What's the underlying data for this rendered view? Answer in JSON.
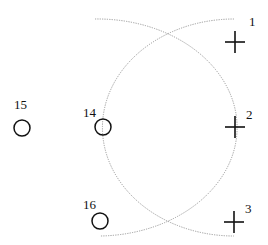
{
  "crosses": [
    {
      "id": "1",
      "x": 235,
      "y": 42,
      "label": "1",
      "lx": 249,
      "ly": 26
    },
    {
      "id": "2",
      "x": 235,
      "y": 127,
      "label": "2",
      "lx": 246,
      "ly": 119
    },
    {
      "id": "3",
      "x": 234,
      "y": 222,
      "label": "3",
      "lx": 245,
      "ly": 213
    }
  ],
  "circles": [
    {
      "id": "15",
      "x": 22,
      "y": 128,
      "label": "15",
      "lx": 14,
      "ly": 109
    },
    {
      "id": "14",
      "x": 103,
      "y": 127,
      "label": "14",
      "lx": 83,
      "ly": 117
    },
    {
      "id": "16",
      "x": 100,
      "y": 221,
      "label": "16",
      "lx": 83,
      "ly": 209
    }
  ],
  "colors": {
    "marker": "#111111",
    "arc": "#9a9a9a"
  }
}
